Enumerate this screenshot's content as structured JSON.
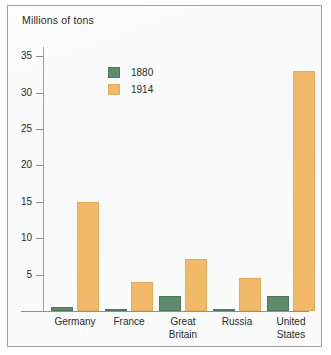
{
  "chart_data": {
    "type": "bar",
    "title": "Millions of tons",
    "xlabel": "",
    "ylabel": "Millions of tons",
    "ylim": [
      0,
      36
    ],
    "yticks": [
      5,
      10,
      15,
      20,
      25,
      30,
      35
    ],
    "ytick_labels": [
      "5",
      "10",
      "15",
      "20",
      "25",
      "30",
      "35"
    ],
    "grid": false,
    "legend_position": "upper-left-inside",
    "categories": [
      "Germany",
      "France",
      "Great\nBritain",
      "Russia",
      "United\nStates"
    ],
    "series": [
      {
        "name": "1880",
        "color": "#5d8b6c",
        "values": [
          0.6,
          0.25,
          2.0,
          0.25,
          2.1
        ]
      },
      {
        "name": "1914",
        "color": "#f2b968",
        "values": [
          15.0,
          4.0,
          7.1,
          4.5,
          33.0
        ]
      }
    ]
  },
  "frame": {
    "border_color": "#9aa0a6",
    "background": "#fbfcfc"
  }
}
